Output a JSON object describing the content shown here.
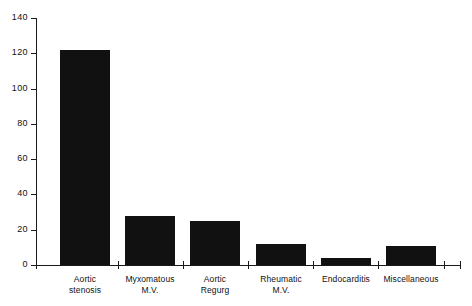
{
  "chart_data": {
    "type": "bar",
    "title": "",
    "subtitle": "",
    "xlabel": "",
    "ylabel": "",
    "ylim": [
      0,
      140
    ],
    "yticks": [
      0,
      20,
      40,
      60,
      80,
      100,
      120,
      140
    ],
    "ytick_labels": [
      "0",
      "20",
      "40",
      "60",
      "80",
      "100",
      "120",
      "140"
    ],
    "grid": false,
    "legend": null,
    "categories": [
      "Aortic\nstenosis",
      "Myxomatous\nM.V.",
      "Aortic\nRegurg",
      "Rheumatic\nM.V.",
      "Endocarditis",
      "Miscellaneous"
    ],
    "values": [
      122,
      28,
      25,
      12,
      4,
      11
    ],
    "bar_color": "#111111",
    "axis_color": "#1a1a1a",
    "background": "#ffffff"
  }
}
